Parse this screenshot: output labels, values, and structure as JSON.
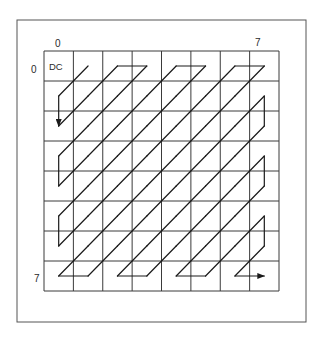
{
  "figure": {
    "grid": {
      "rows": 8,
      "cols": 8,
      "dc_label": "DC",
      "col_labels": {
        "first": "0",
        "last": "7"
      },
      "row_labels": {
        "first": "0",
        "last": "7"
      }
    },
    "scan": {
      "type": "zig-zag",
      "start_cell": [
        0,
        1
      ],
      "end_cell": [
        7,
        7
      ],
      "order": [
        [
          0,
          0
        ],
        [
          0,
          1
        ],
        [
          1,
          0
        ],
        [
          2,
          0
        ],
        [
          1,
          1
        ],
        [
          0,
          2
        ],
        [
          0,
          3
        ],
        [
          1,
          2
        ],
        [
          2,
          1
        ],
        [
          3,
          0
        ],
        [
          4,
          0
        ],
        [
          3,
          1
        ],
        [
          2,
          2
        ],
        [
          1,
          3
        ],
        [
          0,
          4
        ],
        [
          0,
          5
        ],
        [
          1,
          4
        ],
        [
          2,
          3
        ],
        [
          3,
          2
        ],
        [
          4,
          1
        ],
        [
          5,
          0
        ],
        [
          6,
          0
        ],
        [
          5,
          1
        ],
        [
          4,
          2
        ],
        [
          3,
          3
        ],
        [
          2,
          4
        ],
        [
          1,
          5
        ],
        [
          0,
          6
        ],
        [
          0,
          7
        ],
        [
          1,
          6
        ],
        [
          2,
          5
        ],
        [
          3,
          4
        ],
        [
          4,
          3
        ],
        [
          5,
          2
        ],
        [
          6,
          1
        ],
        [
          7,
          0
        ],
        [
          7,
          1
        ],
        [
          6,
          2
        ],
        [
          5,
          3
        ],
        [
          4,
          4
        ],
        [
          3,
          5
        ],
        [
          2,
          6
        ],
        [
          1,
          7
        ],
        [
          2,
          7
        ],
        [
          3,
          6
        ],
        [
          4,
          5
        ],
        [
          5,
          4
        ],
        [
          6,
          3
        ],
        [
          7,
          2
        ],
        [
          7,
          3
        ],
        [
          6,
          4
        ],
        [
          5,
          5
        ],
        [
          4,
          6
        ],
        [
          3,
          7
        ],
        [
          4,
          7
        ],
        [
          5,
          6
        ],
        [
          6,
          5
        ],
        [
          7,
          4
        ],
        [
          7,
          5
        ],
        [
          6,
          6
        ],
        [
          5,
          7
        ],
        [
          6,
          7
        ],
        [
          7,
          6
        ],
        [
          7,
          7
        ]
      ],
      "arrows_at_cells": [
        [
          2,
          0
        ],
        [
          7,
          7
        ]
      ]
    },
    "colors": {
      "line": "#1a1a1a",
      "grid": "#3a3a3a",
      "frame": "#555555",
      "background": "#ffffff"
    }
  }
}
